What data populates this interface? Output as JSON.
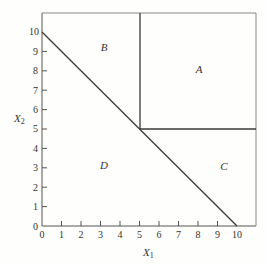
{
  "diagram": {
    "axes": {
      "x": {
        "label": "X",
        "subscript": "1",
        "ticks": [
          "0",
          "1",
          "2",
          "3",
          "4",
          "5",
          "6",
          "7",
          "8",
          "9",
          "10"
        ],
        "range": [
          0,
          11
        ]
      },
      "y": {
        "label": "X",
        "subscript": "2",
        "ticks": [
          "0",
          "1",
          "2",
          "3",
          "4",
          "5",
          "6",
          "7",
          "8",
          "9",
          "10"
        ],
        "range": [
          0,
          11
        ]
      }
    },
    "regions": {
      "A": "A",
      "B": "B",
      "C": "C",
      "D": "D"
    },
    "lines": [
      {
        "name": "diagonal",
        "from": [
          0,
          10
        ],
        "to": [
          10,
          0
        ]
      },
      {
        "name": "vertical-x1-5",
        "from": [
          5,
          5
        ],
        "to": [
          5,
          11
        ]
      },
      {
        "name": "horizontal-x2-5",
        "from": [
          5,
          5
        ],
        "to": [
          11,
          5
        ]
      }
    ],
    "colors": {
      "line": "#3a3a3a",
      "frame": "#8a8a8a",
      "background": "#fefefc"
    }
  }
}
